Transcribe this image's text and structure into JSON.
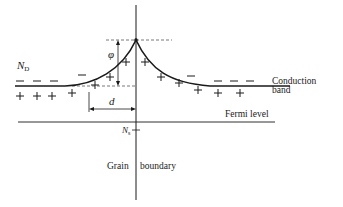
{
  "diagram": {
    "type": "band diagram",
    "colors": {
      "ink": "#1a1a1a",
      "dashed": "#555555",
      "background": "#ffffff"
    },
    "labels": {
      "donor_density": {
        "symbol": "N",
        "subscript": "D"
      },
      "barrier_height": "φ",
      "depletion_width": "d",
      "surface_states": {
        "symbol": "N",
        "subscript": "s"
      },
      "conduction_band": [
        "Conduction",
        "band"
      ],
      "fermi_level": "Fermi level",
      "grain_boundary": [
        "Grain",
        "boundary"
      ]
    },
    "charges": {
      "positive_symbol": "+",
      "negative_symbol": "−"
    }
  }
}
